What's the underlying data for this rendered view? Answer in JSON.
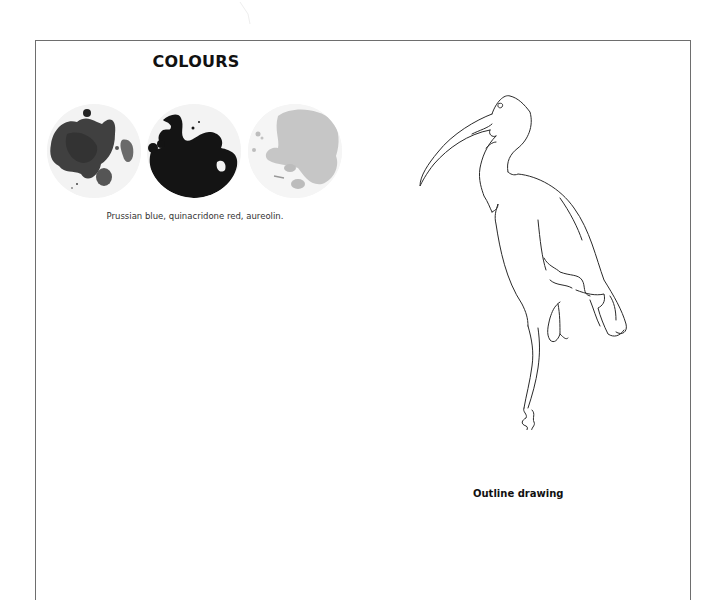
{
  "colours": {
    "title": "COLOURS",
    "swatches": [
      {
        "name": "Prussian blue",
        "color": "#3c3c3c"
      },
      {
        "name": "quinacridone red",
        "color": "#111111"
      },
      {
        "name": "aureolin",
        "color": "#c4c4c4"
      }
    ],
    "caption": "Prussian blue, quinacridone red, aureolin."
  },
  "drawing": {
    "subject": "ibis",
    "label": "Outline drawing"
  }
}
